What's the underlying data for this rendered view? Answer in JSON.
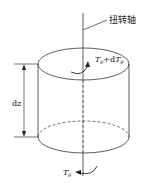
{
  "diagram": {
    "axis_label": "扭转轴",
    "dimension_label": "dz",
    "top_torque_label": {
      "T": "T",
      "sub": "θ",
      "plus": "+d",
      "T2": "T",
      "sub2": "θ"
    },
    "bottom_torque_label": {
      "T": "T",
      "sub": "θ"
    },
    "colors": {
      "stroke": "#333333",
      "background": "#ffffff"
    }
  }
}
